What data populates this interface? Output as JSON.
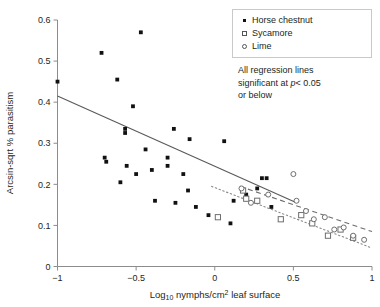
{
  "chart_data": {
    "type": "scatter",
    "title": "",
    "xlabel": "Log10 nymphs/cm2 leaf surface",
    "ylabel": "Arcsin-sqrt % parasitism",
    "xlim": [
      -1,
      1
    ],
    "ylim": [
      0,
      0.6
    ],
    "xticks": [
      -1,
      -0.5,
      0,
      0.5,
      1
    ],
    "xtick_labels": [
      "−1",
      "−0.5",
      "0",
      "0.5",
      "1"
    ],
    "yticks": [
      0,
      0.1,
      0.2,
      0.3,
      0.4,
      0.5,
      0.6
    ],
    "ytick_labels": [
      "0",
      "0.1",
      "0.2",
      "0.3",
      "0.4",
      "0.5",
      "0.6"
    ],
    "grid": false,
    "legend_position": "top-right",
    "series": [
      {
        "name": "Horse chestnut",
        "marker": "filled-square",
        "regression": "solid",
        "points": [
          [
            -1.0,
            0.45
          ],
          [
            -0.72,
            0.52
          ],
          [
            -0.7,
            0.265
          ],
          [
            -0.69,
            0.255
          ],
          [
            -0.62,
            0.455
          ],
          [
            -0.6,
            0.205
          ],
          [
            -0.57,
            0.335
          ],
          [
            -0.57,
            0.325
          ],
          [
            -0.56,
            0.245
          ],
          [
            -0.52,
            0.39
          ],
          [
            -0.5,
            0.225
          ],
          [
            -0.47,
            0.57
          ],
          [
            -0.44,
            0.285
          ],
          [
            -0.4,
            0.235
          ],
          [
            -0.38,
            0.16
          ],
          [
            -0.3,
            0.265
          ],
          [
            -0.3,
            0.245
          ],
          [
            -0.26,
            0.335
          ],
          [
            -0.25,
            0.155
          ],
          [
            -0.2,
            0.225
          ],
          [
            -0.17,
            0.185
          ],
          [
            -0.16,
            0.31
          ],
          [
            -0.12,
            0.145
          ],
          [
            -0.04,
            0.125
          ],
          [
            0.06,
            0.305
          ],
          [
            0.12,
            0.16
          ],
          [
            0.2,
            0.175
          ],
          [
            0.3,
            0.215
          ],
          [
            0.33,
            0.215
          ],
          [
            0.27,
            0.19
          ],
          [
            0.36,
            0.145
          ],
          [
            0.1,
            0.105
          ]
        ],
        "regression_line": [
          [
            -1.0,
            0.415
          ],
          [
            0.52,
            0.155
          ]
        ]
      },
      {
        "name": "Sycamore",
        "marker": "open-square",
        "regression": "dashed",
        "points": [
          [
            0.02,
            0.12
          ],
          [
            0.18,
            0.185
          ],
          [
            0.2,
            0.165
          ],
          [
            0.27,
            0.16
          ],
          [
            0.42,
            0.115
          ],
          [
            0.55,
            0.125
          ],
          [
            0.62,
            0.105
          ],
          [
            0.72,
            0.075
          ],
          [
            0.8,
            0.09
          ],
          [
            0.88,
            0.07
          ]
        ],
        "regression_line": [
          [
            0.16,
            0.195
          ],
          [
            1.0,
            0.085
          ]
        ]
      },
      {
        "name": "Lime",
        "marker": "open-circle",
        "regression": "dotted",
        "points": [
          [
            0.17,
            0.19
          ],
          [
            0.23,
            0.155
          ],
          [
            0.34,
            0.175
          ],
          [
            0.5,
            0.225
          ],
          [
            0.52,
            0.16
          ],
          [
            0.58,
            0.135
          ],
          [
            0.63,
            0.115
          ],
          [
            0.7,
            0.12
          ],
          [
            0.76,
            0.09
          ],
          [
            0.82,
            0.095
          ],
          [
            0.88,
            0.075
          ],
          [
            0.95,
            0.065
          ]
        ],
        "regression_line": [
          [
            -0.02,
            0.195
          ],
          [
            1.0,
            0.045
          ]
        ]
      }
    ],
    "annotations": [
      "All regression lines",
      "significant at p< 0.05",
      "or below"
    ]
  },
  "legend": {
    "items": [
      {
        "label": "Horse chestnut"
      },
      {
        "label": "Sycamore"
      },
      {
        "label": "Lime"
      }
    ]
  },
  "note": {
    "line1": "All regression lines",
    "line2_pre": "significant at ",
    "line2_italic": "p",
    "line2_post": "< 0.05",
    "line3": "or below"
  },
  "axes": {
    "y_title": "Arcsin-sqrt % parasitism",
    "x_title_pre": "Log",
    "x_title_sub": "10",
    "x_title_mid": " nymphs/cm",
    "x_title_sup": "2",
    "x_title_post": " leaf surface"
  }
}
